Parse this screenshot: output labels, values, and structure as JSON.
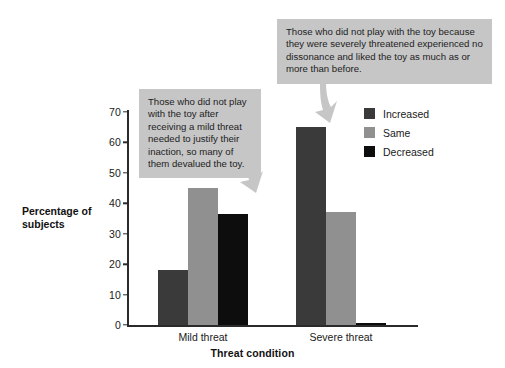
{
  "chart_data": {
    "type": "bar",
    "title": "",
    "xlabel": "Threat condition",
    "ylabel": "Percentage of subjects",
    "categories": [
      "Mild threat",
      "Severe threat"
    ],
    "series": [
      {
        "name": "Increased",
        "color": "#3a3a3a",
        "values": [
          18,
          65
        ]
      },
      {
        "name": "Same",
        "color": "#909090",
        "values": [
          45,
          37
        ]
      },
      {
        "name": "Decreased",
        "color": "#0d0d0d",
        "values": [
          36.5,
          0.7
        ]
      }
    ],
    "ylim": [
      0,
      70
    ],
    "yticks": [
      "0",
      "10",
      "20",
      "30",
      "40",
      "50",
      "60",
      "70"
    ],
    "grid": false,
    "legend_position": "upper right",
    "annotations": [
      "Those who did not play with the toy after receiving a mild threat needed to justify their inaction, so many of them devalued the toy.",
      "Those who did not play with the toy because they were severely threatened experienced no dissonance and liked the toy as much as or more than before."
    ]
  },
  "axis": {
    "y_title": "Percentage of subjects",
    "x_title": "Threat condition"
  },
  "legend": {
    "items": [
      {
        "label": "Increased"
      },
      {
        "label": "Same"
      },
      {
        "label": "Decreased"
      }
    ]
  }
}
